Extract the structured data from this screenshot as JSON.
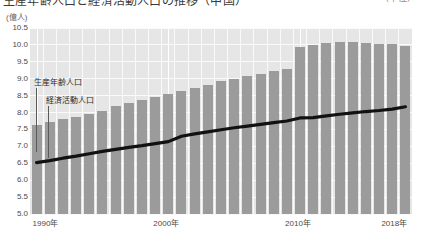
{
  "header": {
    "title": "生産年齢人口と経済活動人口の推移（中国）",
    "title_right": "（単位）"
  },
  "axes": {
    "unit_label": "(億人)",
    "y_ticks": [
      "10.5",
      "10.0",
      "9.5",
      "9.0",
      "8.5",
      "8.0",
      "7.5",
      "7.0",
      "6.5",
      "6.0",
      "5.5",
      "5.0"
    ],
    "y_min": 5.0,
    "y_max": 10.5,
    "y_step": 0.5,
    "x_ticks": [
      {
        "label": "1990年",
        "year": 1990
      },
      {
        "label": "2000年",
        "year": 2000
      },
      {
        "label": "2010年",
        "year": 2010
      },
      {
        "label": "2018年",
        "year": 2018
      }
    ]
  },
  "annotations": [
    {
      "name": "working-age-population",
      "label": "生産年齢人口",
      "x": 34,
      "y": 78
    },
    {
      "name": "economically-active-population",
      "label": "経済活動人口",
      "x": 46,
      "y": 96
    }
  ],
  "colors": {
    "bar": "#9b9b9b",
    "line": "#111111",
    "plot_background": "#e6e6e6",
    "gridline": "#fafafa",
    "page_background": "#ffffff",
    "tick_text": "#4a4a4a"
  },
  "chart_data": {
    "type": "bar",
    "title": "生産年齢人口と経済活動人口の推移（中国）",
    "xlabel": "",
    "ylabel": "(億人)",
    "ylim": [
      5.0,
      10.5
    ],
    "grid": true,
    "legend": "none",
    "categories": [
      "1990年",
      "1991年",
      "1992年",
      "1993年",
      "1994年",
      "1995年",
      "1996年",
      "1997年",
      "1998年",
      "1999年",
      "2000年",
      "2001年",
      "2002年",
      "2003年",
      "2004年",
      "2005年",
      "2006年",
      "2007年",
      "2008年",
      "2009年",
      "2010年",
      "2011年",
      "2012年",
      "2013年",
      "2014年",
      "2015年",
      "2016年",
      "2017年",
      "2018年"
    ],
    "x": [
      1990,
      1991,
      1992,
      1993,
      1994,
      1995,
      1996,
      1997,
      1998,
      1999,
      2000,
      2001,
      2002,
      2003,
      2004,
      2005,
      2006,
      2007,
      2008,
      2009,
      2010,
      2011,
      2012,
      2013,
      2014,
      2015,
      2016,
      2017,
      2018
    ],
    "series": [
      {
        "name": "生産年齢人口",
        "type": "bar",
        "unit": "億人",
        "values": [
          7.63,
          7.72,
          7.8,
          7.88,
          7.96,
          8.05,
          8.2,
          8.27,
          8.38,
          8.47,
          8.55,
          8.63,
          8.72,
          8.82,
          8.92,
          9.0,
          9.07,
          9.14,
          9.23,
          9.3,
          9.93,
          10.0,
          10.05,
          10.08,
          10.09,
          10.06,
          10.03,
          10.02,
          9.98
        ]
      },
      {
        "name": "経済活動人口",
        "type": "line",
        "unit": "億人",
        "values": [
          6.52,
          6.58,
          6.65,
          6.71,
          6.78,
          6.85,
          6.91,
          6.97,
          7.02,
          7.08,
          7.14,
          7.3,
          7.37,
          7.43,
          7.49,
          7.55,
          7.6,
          7.65,
          7.7,
          7.75,
          7.84,
          7.85,
          7.9,
          7.95,
          7.99,
          8.03,
          8.06,
          8.1,
          8.17
        ]
      }
    ]
  }
}
